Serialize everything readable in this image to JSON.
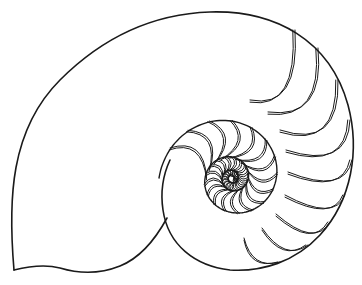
{
  "illustration": {
    "subject": "nautilus shell cross-section line drawing",
    "colors": {
      "background": "#ffffff",
      "stroke": "#1a1a1a"
    },
    "outline": {
      "path": "M14,270 C8,200 10,130 60,80 C100,40 150,14 210,12 C275,10 330,40 348,105 C360,150 352,200 320,235 C295,262 262,272 230,270 C195,266 168,245 163,210 C160,190 163,175 170,160",
      "body_lower": "M14,270 C30,266 45,264 60,268 C80,274 100,274 120,266 C140,258 155,240 167,218",
      "stroke_width": 1.6
    },
    "whorl": {
      "center": [
        232,
        178
      ],
      "turns": 3.2,
      "start_radius": 3,
      "end_radius": 73,
      "stroke_width": 1.4
    },
    "septa": {
      "count": 44,
      "stroke_width": 1.0,
      "double_offset": 2.2
    }
  }
}
